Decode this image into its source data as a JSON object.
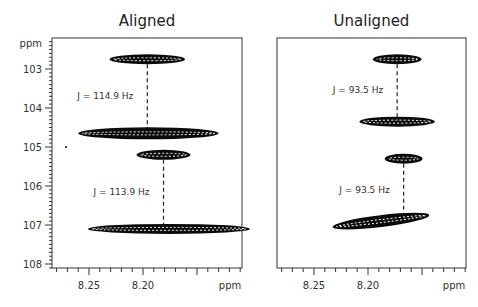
{
  "chart_data": [
    {
      "type": "scatter",
      "subtype": "2D NMR contour (HSQC-type)",
      "title": "Aligned",
      "xlabel": "ppm",
      "ylabel": "ppm",
      "xlim": [
        8.285,
        8.11
      ],
      "ylim": [
        102.3,
        108.1
      ],
      "x_ticks": [
        8.25,
        8.2
      ],
      "x_tick_labels": [
        "8.25",
        "8.20"
      ],
      "y_ticks": [
        103,
        104,
        105,
        106,
        107,
        108
      ],
      "y_tick_labels": [
        "103",
        "104",
        "105",
        "106",
        "107",
        "108"
      ],
      "peaks": [
        {
          "x": 8.196,
          "y": 102.75,
          "x_width": 0.07,
          "label": "peak-1"
        },
        {
          "x": 8.195,
          "y": 104.65,
          "x_width": 0.13,
          "label": "peak-2"
        },
        {
          "x": 8.181,
          "y": 105.2,
          "x_width": 0.05,
          "label": "peak-3"
        },
        {
          "x": 8.176,
          "y": 107.1,
          "x_width": 0.15,
          "label": "peak-4"
        }
      ],
      "couplings": [
        {
          "x": 8.196,
          "y_from": 102.75,
          "y_to": 104.65,
          "label": "J = 114.9 Hz"
        },
        {
          "x": 8.181,
          "y_from": 105.2,
          "y_to": 107.1,
          "label": "J = 113.9 Hz"
        }
      ]
    },
    {
      "type": "scatter",
      "subtype": "2D NMR contour (HSQC-type)",
      "title": "Unaligned",
      "xlabel": "ppm",
      "ylabel": "ppm",
      "xlim": [
        8.285,
        8.11
      ],
      "ylim": [
        102.3,
        108.1
      ],
      "x_ticks": [
        8.25,
        8.2
      ],
      "x_tick_labels": [
        "8.25",
        "8.20"
      ],
      "peaks": [
        {
          "x": 8.173,
          "y": 102.75,
          "x_width": 0.045,
          "label": "peak-1"
        },
        {
          "x": 8.173,
          "y": 104.35,
          "x_width": 0.07,
          "label": "peak-2"
        },
        {
          "x": 8.167,
          "y": 105.3,
          "x_width": 0.035,
          "label": "peak-3"
        },
        {
          "x": 8.188,
          "y": 106.9,
          "x_width": 0.09,
          "label": "peak-4"
        }
      ],
      "couplings": [
        {
          "x": 8.173,
          "y_from": 102.75,
          "y_to": 104.35,
          "label": "J = 93.5 Hz"
        },
        {
          "x": 8.167,
          "y_from": 105.3,
          "y_to": 106.9,
          "label": "J = 93.5 Hz"
        }
      ]
    }
  ]
}
